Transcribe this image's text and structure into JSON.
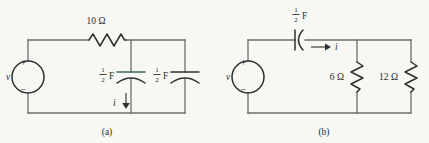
{
  "figure": {
    "background_color": "#f7f7f4",
    "wire_color": "#6e6f6b",
    "component_color": "#2f3130",
    "accent_color": "#3d6b63"
  },
  "circuit_a": {
    "caption": "(a)",
    "source": {
      "label": "v",
      "plus": "+",
      "minus": "−",
      "type": "voltage-source"
    },
    "resistor": {
      "label": "10 Ω",
      "value": "10",
      "unit": "Ω",
      "orientation": "horizontal"
    },
    "capacitor_1": {
      "numerator": "1",
      "denominator": "2",
      "unit": "F",
      "label": "1/2 F",
      "orientation": "horizontal"
    },
    "capacitor_2": {
      "numerator": "1",
      "denominator": "2",
      "unit": "F",
      "label": "1/2 F",
      "orientation": "horizontal"
    },
    "current": {
      "label": "i",
      "direction": "down"
    }
  },
  "circuit_b": {
    "caption": "(b)",
    "source": {
      "label": "v",
      "plus": "+",
      "minus": "−",
      "type": "voltage-source"
    },
    "capacitor": {
      "numerator": "1",
      "denominator": "2",
      "unit": "F",
      "label": "1/2 F",
      "orientation": "horizontal"
    },
    "resistor_1": {
      "label": "6 Ω",
      "value": "6",
      "unit": "Ω",
      "orientation": "vertical"
    },
    "resistor_2": {
      "label": "12 Ω",
      "value": "12",
      "unit": "Ω",
      "orientation": "vertical"
    },
    "current": {
      "label": "i",
      "direction": "right"
    }
  }
}
